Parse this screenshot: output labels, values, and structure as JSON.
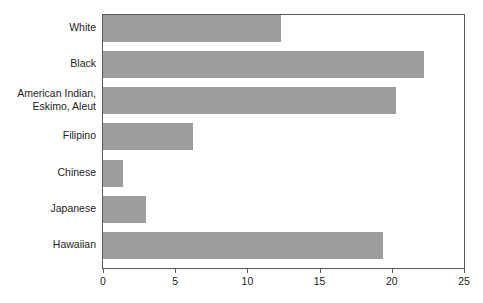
{
  "chart": {
    "type": "bar",
    "orientation": "horizontal",
    "bar_color": "#9d9d9d",
    "frame_color": "#5a5a5a",
    "axis_text_color": "#1d1d1d"
  },
  "chart_data": {
    "type": "bar",
    "title": "",
    "subtitle": "",
    "xlabel": "",
    "ylabel": "",
    "orientation": "horizontal",
    "grid": false,
    "legend": false,
    "xlim": [
      0,
      25
    ],
    "xticks": [
      0,
      5,
      10,
      15,
      20,
      25
    ],
    "xtick_labels": [
      "0",
      "5",
      "10",
      "15",
      "20",
      "25"
    ],
    "categories": [
      "White",
      "Black",
      "American Indian,\nEskimo, Aleut",
      "Filipino",
      "Chinese",
      "Japanese",
      "Hawaiian"
    ],
    "values": [
      12.3,
      22.2,
      20.3,
      6.2,
      1.4,
      3.0,
      19.4
    ]
  }
}
